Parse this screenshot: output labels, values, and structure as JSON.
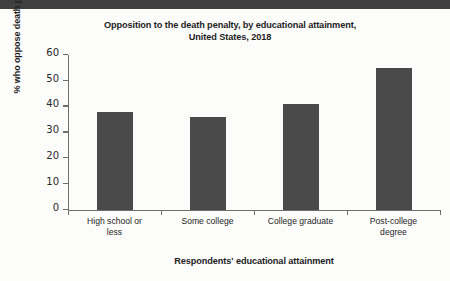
{
  "chart_data": {
    "type": "bar",
    "title": "Opposition to the death penalty, by educational attainment, United States, 2018",
    "title_lines": [
      "Opposition to the death penalty, by educational attainment,",
      "United States, 2018"
    ],
    "categories": [
      "High school or less",
      "Some college",
      "College graduate",
      "Post-college degree"
    ],
    "category_lines": [
      [
        "High school or",
        "less"
      ],
      [
        "Some college"
      ],
      [
        "College graduate"
      ],
      [
        "Post-college",
        "degree"
      ]
    ],
    "values": [
      38,
      36,
      41,
      55
    ],
    "xlabel": "Respondents' educational attainment",
    "ylabel": "% who oppose death penalty",
    "ylim": [
      0,
      60
    ],
    "ytick_labels": [
      "0",
      "10",
      "20",
      "30",
      "40",
      "50",
      "60"
    ],
    "ytick_values": [
      0,
      10,
      20,
      30,
      40,
      50,
      60
    ],
    "grid": false,
    "legend": "none",
    "bar_color": "#4a4a4a",
    "axis_color": "#6e6e6e",
    "background_color": "#fcfcfb",
    "banner_color": "#3f3f3f"
  }
}
